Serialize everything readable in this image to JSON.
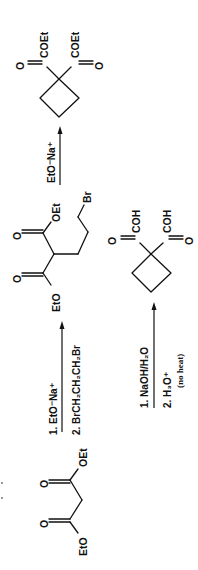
{
  "scheme": {
    "orientation": "rotated -90deg (reads bottom to top)",
    "starting_material": {
      "name": "diethyl malonate",
      "labels": {
        "ester_left": "EtO",
        "ester_right": "OEt",
        "carbonyl_o": "O"
      }
    },
    "step1": {
      "reagent_1": "1.  EtO⁻Na⁺",
      "reagent_2": "2.  BrCH₂CH₂CH₂Br"
    },
    "intermediate": {
      "name": "diethyl 2-(3-bromopropyl)malonate",
      "labels": {
        "ester_left": "EtO",
        "ester_right": "OEt",
        "carbonyl_o": "O",
        "halide": "Br"
      }
    },
    "step2": {
      "reagent": "EtO⁻Na⁺"
    },
    "product_diester": {
      "name": "diethyl cyclobutane-1,1-dicarboxylate",
      "labels": {
        "ester_group": "COEt",
        "carbonyl_o": "O"
      }
    },
    "step3": {
      "reagent_1": "1.  NaOH/H₂O",
      "reagent_2": "2.  H₃O⁺",
      "note": "(no heat)"
    },
    "product_diacid": {
      "name": "cyclobutane-1,1-dicarboxylic acid",
      "labels": {
        "acid_group": "COH",
        "carbonyl_o": "O"
      }
    }
  }
}
